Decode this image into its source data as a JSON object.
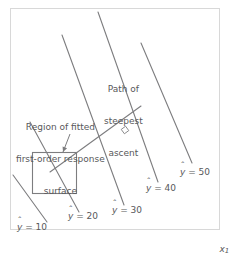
{
  "figure": {
    "type": "contour-diagram",
    "frame": {
      "x": 10,
      "y": 8,
      "width": 209,
      "height": 221,
      "border_color": "#d8d8d8",
      "background": "#ffffff"
    },
    "line_color": "#7d7d7f",
    "text_color": "#58585a"
  },
  "annotations": {
    "region": {
      "line1": "Region of fitted",
      "line2": "first-order response",
      "line3": "surface",
      "x": 16,
      "y": 101
    },
    "path": {
      "line1": "Path of",
      "line2": "steepest",
      "line3": "ascent",
      "x": 104,
      "y": 63
    }
  },
  "axis": {
    "x_label": "x",
    "x_subscript": "1",
    "x": 208,
    "y": 233
  },
  "chart_data": {
    "type": "contour",
    "title": "",
    "xlabel": "x1",
    "ylabel": "",
    "grid": false,
    "legend": "none",
    "response_variable": "y-hat",
    "contour_levels": [
      10,
      20,
      30,
      40,
      50
    ],
    "contours": [
      {
        "level": 10,
        "label": "10",
        "x1": 13,
        "y1": 175,
        "x2": 47,
        "y2": 222,
        "label_x": 17,
        "label_y": 222
      },
      {
        "level": 20,
        "label": "20",
        "x1": 30,
        "y1": 122,
        "x2": 79,
        "y2": 212,
        "label_x": 68,
        "label_y": 211
      },
      {
        "level": 30,
        "label": "30",
        "x1": 62,
        "y1": 35,
        "x2": 124,
        "y2": 205,
        "label_x": 112,
        "label_y": 205
      },
      {
        "level": 40,
        "label": "40",
        "x1": 98,
        "y1": 12,
        "x2": 158,
        "y2": 182,
        "label_x": 146,
        "label_y": 183
      },
      {
        "level": 50,
        "label": "50",
        "x1": 141,
        "y1": 43,
        "x2": 192,
        "y2": 163,
        "label_x": 180,
        "label_y": 167
      }
    ],
    "region_square": {
      "x": 32,
      "y": 152,
      "width": 44,
      "height": 41,
      "note": "Region of fitted first-order response surface"
    },
    "steepest_ascent_path": {
      "x1": 50,
      "y1": 172,
      "x2": 141,
      "y2": 106,
      "perpendicular_marker": {
        "x": 125,
        "y": 130
      },
      "note": "Path of steepest ascent, perpendicular to contours"
    },
    "pointer_arrow": {
      "from_x": 70,
      "from_y": 134,
      "to_x": 63,
      "to_y": 152
    }
  }
}
